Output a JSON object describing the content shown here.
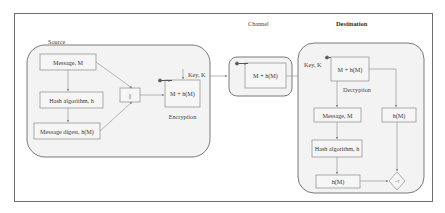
{
  "diagram": {
    "type": "flowchart",
    "sections": {
      "source": {
        "label": "Source"
      },
      "channel": {
        "label": "Channel"
      },
      "destination": {
        "label": "Destination"
      }
    },
    "source_nodes": {
      "message": "Message, M",
      "hash_algorithm": "Hash algorithm, h",
      "message_digest": "Message digest, h(M)",
      "concat": "||",
      "encrypted_payload": "M + h(M)",
      "encryption_label": "Encryption",
      "key_label": "Key, K"
    },
    "channel_nodes": {
      "payload": "M + h(M)"
    },
    "destination_nodes": {
      "key_label": "Key, K",
      "encrypted_payload": "M + h(M)",
      "decryption_label": "Decryption",
      "message": "Message, M",
      "hash_algorithm": "Hash algorithm, h",
      "computed_hash": "h(M)",
      "received_hash": "h(M)",
      "compare": "=?"
    },
    "colors": {
      "frame": "#6d6d6d",
      "group_fill": "#f3f3f3",
      "box_fill": "#f6f6f6",
      "connector": "#9a9a9a",
      "text": "#3a3a3a"
    },
    "edges": [
      [
        "Message, M",
        "||"
      ],
      [
        "Message, M",
        "Hash algorithm, h"
      ],
      [
        "Hash algorithm, h",
        "Message digest, h(M)"
      ],
      [
        "Message digest, h(M)",
        "||"
      ],
      [
        "||",
        "M + h(M) (Encryption)"
      ],
      [
        "Key, K",
        "M + h(M) (Encryption)"
      ],
      [
        "M + h(M) (Encryption)",
        "M + h(M) (Channel)"
      ],
      [
        "M + h(M) (Channel)",
        "M + h(M) (Decryption)"
      ],
      [
        "M + h(M) (Decryption)",
        "Message, M"
      ],
      [
        "M + h(M) (Decryption)",
        "h(M) received"
      ],
      [
        "Message, M",
        "Hash algorithm, h"
      ],
      [
        "Hash algorithm, h",
        "h(M) computed"
      ],
      [
        "h(M) computed",
        "=?"
      ],
      [
        "h(M) received",
        "=?"
      ]
    ]
  }
}
